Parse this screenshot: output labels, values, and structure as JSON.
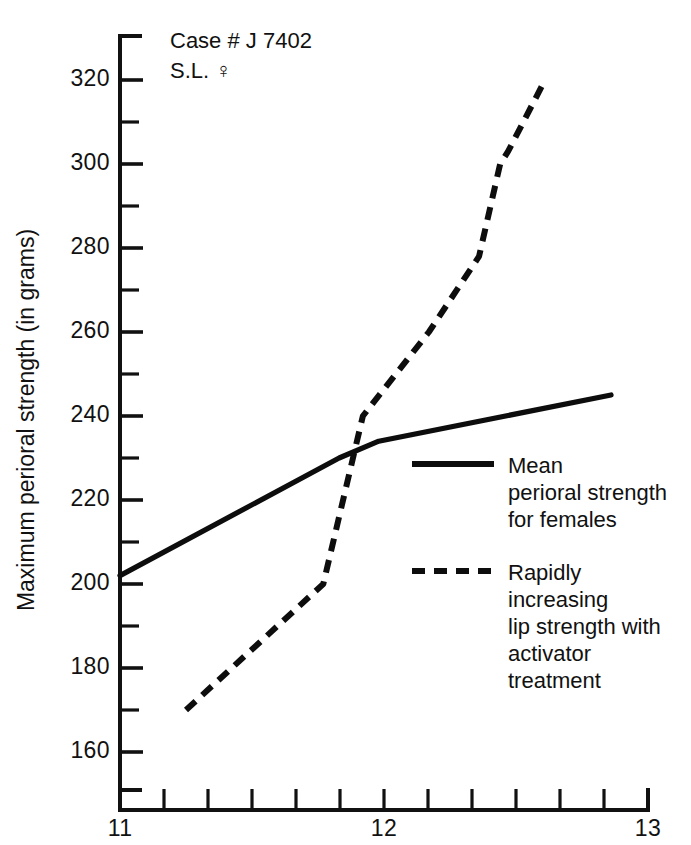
{
  "chart_data": {
    "type": "line",
    "title": "",
    "xlabel": "",
    "ylabel": "Maximum perioral strength (in grams)",
    "xlim": [
      11,
      13
    ],
    "ylim": [
      152,
      327
    ],
    "grid": false,
    "legend_position": "center-right",
    "x_ticks_labeled": [
      "11",
      "12",
      "13"
    ],
    "x_tick_values_labeled": [
      11,
      12,
      13
    ],
    "x_minor_tick_count": 12,
    "y_ticks_labeled": [
      "320",
      "300",
      "280",
      "260",
      "240",
      "220",
      "200",
      "180",
      "160"
    ],
    "y_tick_values_labeled": [
      320,
      300,
      280,
      260,
      240,
      220,
      200,
      180,
      160
    ],
    "y_minor_tick_step": 10,
    "series": [
      {
        "name": "Mean perioral strength for females",
        "style": "solid",
        "color": "#0d0d0d",
        "x": [
          11.0,
          11.83,
          11.98,
          12.86
        ],
        "values": [
          202,
          230,
          234,
          245
        ]
      },
      {
        "name": "Rapidly increasing lip strength with activator treatment",
        "style": "dashed",
        "color": "#0d0d0d",
        "x": [
          11.25,
          11.77,
          11.92,
          12.17,
          12.36,
          12.44,
          12.47,
          12.61
        ],
        "values": [
          170,
          200,
          240,
          260,
          278,
          300,
          303,
          320
        ]
      }
    ],
    "annotations": [
      {
        "text": "Case # J 7402",
        "x": 11.2,
        "y": 326
      },
      {
        "text": "S.L. ♀",
        "x": 11.2,
        "y": 319
      }
    ]
  },
  "annotation": {
    "case_line": "Case # J 7402",
    "subject_line": "S.L. ♀"
  },
  "axes": {
    "y_title": "Maximum perioral strength (in grams)",
    "y_labels": [
      "320",
      "300",
      "280",
      "260",
      "240",
      "220",
      "200",
      "180",
      "160"
    ],
    "x_labels": [
      "11",
      "12",
      "13"
    ]
  },
  "legend": {
    "entries": [
      {
        "style": "solid",
        "line1": "Mean",
        "line2": "perioral strength",
        "line3": "for females"
      },
      {
        "style": "dashed",
        "line1": "Rapidly increasing",
        "line2": "lip strength with",
        "line3": "activator treatment"
      }
    ]
  },
  "colors": {
    "ink": "#111111",
    "series": "#0d0d0d",
    "background": "#ffffff"
  }
}
